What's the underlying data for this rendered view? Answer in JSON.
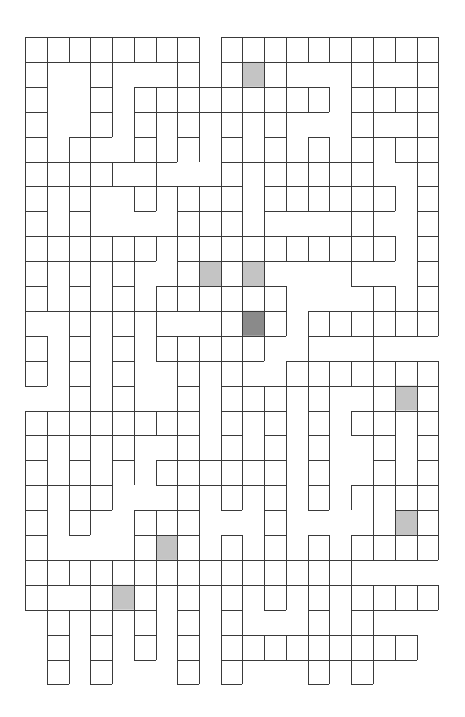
{
  "puzzle": {
    "type": "grid-maze",
    "columns": 19,
    "rows": 26,
    "x_lines": [
      25,
      47,
      69,
      90,
      112,
      134,
      156,
      177,
      199,
      221,
      242,
      264,
      286,
      308,
      329,
      351,
      373,
      395,
      417,
      438
    ],
    "y_start": 37,
    "row_height": 24.9,
    "colors": {
      "wall": "#3a3a3a",
      "background": "#ffffff",
      "light_marker": "#c4c4c4",
      "dark_marker": "#8a8a8a"
    },
    "horizontal_walls": [
      "1111111101111111111",
      "1111111101111111111",
      "1001011111111101111",
      "1001011111111101111",
      "1011010101010101111",
      "1111111001111111011",
      "1111111111011111101",
      "1010010111011111101",
      "1111111111111111101",
      "1111110111111111101",
      "1010101111110001101",
      "1111111111110111111",
      "1010101111110111111",
      "1010101111101111111",
      "1010100101111111111",
      "1111111101110101111",
      "1111111101010101101",
      "1010101111110100101",
      "1111001111110101111",
      "1011011101010100011",
      "1010011101010101111",
      "1111111111111111111",
      "1111111111111111111",
      "1111110101010101111",
      "0101010101111111110",
      "0101010101111111110",
      "0101000101000101000"
    ],
    "vertical_walls": [
      "11111111111111111111",
      "11011001111110011011",
      "11011111111111111111",
      "11011111111110011011",
      "11110111111111111111",
      "11111010011111111011",
      "11110111111111111111",
      "11110001111100011011",
      "11111111111111111111",
      "11111101111100010011",
      "11111111111110001111",
      "10111110011111111111",
      "11111111111101001000",
      "11111101111011111111",
      "00111101111111101111",
      "11111111111111111111",
      "11111101111111101111",
      "11111111111111101111",
      "11111001111111111111",
      "11110111100110001111",
      "11000111111111111111",
      "11111111111111110000",
      "11011111111111111111",
      "01111111111001111000",
      "01111111111111111110",
      "01111001111001111000"
    ],
    "marked_cells": [
      {
        "col": 10,
        "row": 1,
        "shade": "light"
      },
      {
        "col": 8,
        "row": 9,
        "shade": "light"
      },
      {
        "col": 10,
        "row": 9,
        "shade": "light"
      },
      {
        "col": 10,
        "row": 11,
        "shade": "dark"
      },
      {
        "col": 17,
        "row": 14,
        "shade": "light"
      },
      {
        "col": 17,
        "row": 19,
        "shade": "light"
      },
      {
        "col": 6,
        "row": 20,
        "shade": "light"
      },
      {
        "col": 4,
        "row": 22,
        "shade": "light"
      }
    ]
  }
}
